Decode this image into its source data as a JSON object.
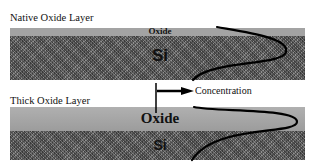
{
  "panels": [
    {
      "title": "Native Oxide Layer",
      "oxide_label": "Oxide",
      "substrate_label": "Si"
    },
    {
      "title": "Thick Oxide Layer",
      "oxide_label": "Oxide",
      "substrate_label": "Si"
    }
  ],
  "axis": {
    "label": "Concentration"
  },
  "colors": {
    "oxide": "#a3a3a3",
    "silicon": "#6e6e6e",
    "curve": "#000000"
  }
}
